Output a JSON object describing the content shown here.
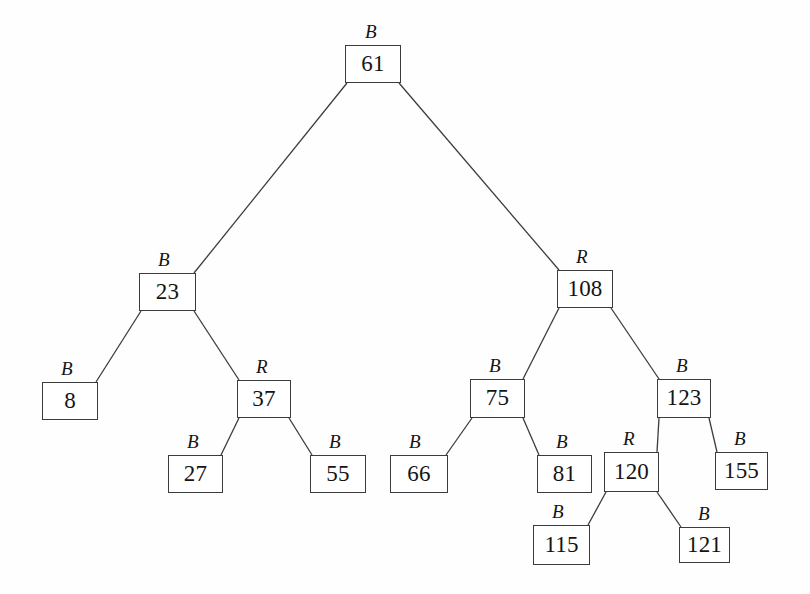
{
  "diagram": {
    "type": "binary-search-tree",
    "background_color": "#fefefe",
    "line_color": "#3c3c3c",
    "text_color": "#141414",
    "color_legend": {
      "B": "Black",
      "R": "Red"
    },
    "nodes": [
      {
        "id": "n61",
        "value": "61",
        "color_label": "B",
        "x": 345,
        "y": 45,
        "w": 56,
        "h": 38,
        "label_x": 365,
        "label_y": 22,
        "parent": null,
        "side": "root"
      },
      {
        "id": "n23",
        "value": "23",
        "color_label": "B",
        "x": 139,
        "y": 273,
        "w": 57,
        "h": 38,
        "label_x": 158,
        "label_y": 250,
        "parent": "n61",
        "side": "left"
      },
      {
        "id": "n108",
        "value": "108",
        "color_label": "R",
        "x": 557,
        "y": 270,
        "w": 56,
        "h": 38,
        "label_x": 576,
        "label_y": 247,
        "parent": "n61",
        "side": "right"
      },
      {
        "id": "n8",
        "value": "8",
        "color_label": "B",
        "x": 42,
        "y": 382,
        "w": 56,
        "h": 38,
        "label_x": 61,
        "label_y": 359,
        "parent": "n23",
        "side": "left"
      },
      {
        "id": "n37",
        "value": "37",
        "color_label": "R",
        "x": 237,
        "y": 380,
        "w": 54,
        "h": 38,
        "label_x": 256,
        "label_y": 357,
        "parent": "n23",
        "side": "right"
      },
      {
        "id": "n27",
        "value": "27",
        "color_label": "B",
        "x": 168,
        "y": 455,
        "w": 55,
        "h": 38,
        "label_x": 187,
        "label_y": 432,
        "parent": "n37",
        "side": "left"
      },
      {
        "id": "n55",
        "value": "55",
        "color_label": "B",
        "x": 310,
        "y": 455,
        "w": 56,
        "h": 38,
        "label_x": 329,
        "label_y": 432,
        "parent": "n37",
        "side": "right"
      },
      {
        "id": "n75",
        "value": "75",
        "color_label": "B",
        "x": 470,
        "y": 379,
        "w": 55,
        "h": 39,
        "label_x": 489,
        "label_y": 356,
        "parent": "n108",
        "side": "left"
      },
      {
        "id": "n123",
        "value": "123",
        "color_label": "B",
        "x": 657,
        "y": 379,
        "w": 54,
        "h": 39,
        "label_x": 676,
        "label_y": 356,
        "parent": "n108",
        "side": "right"
      },
      {
        "id": "n66",
        "value": "66",
        "color_label": "B",
        "x": 390,
        "y": 455,
        "w": 58,
        "h": 38,
        "label_x": 409,
        "label_y": 432,
        "parent": "n75",
        "side": "left"
      },
      {
        "id": "n81",
        "value": "81",
        "color_label": "B",
        "x": 537,
        "y": 455,
        "w": 55,
        "h": 38,
        "label_x": 556,
        "label_y": 432,
        "parent": "n75",
        "side": "right"
      },
      {
        "id": "n120",
        "value": "120",
        "color_label": "R",
        "x": 604,
        "y": 452,
        "w": 55,
        "h": 40,
        "label_x": 623,
        "label_y": 429,
        "parent": "n123",
        "side": "left"
      },
      {
        "id": "n155",
        "value": "155",
        "color_label": "B",
        "x": 715,
        "y": 452,
        "w": 53,
        "h": 38,
        "label_x": 734,
        "label_y": 429,
        "parent": "n123",
        "side": "right"
      },
      {
        "id": "n115",
        "value": "115",
        "color_label": "B",
        "x": 533,
        "y": 525,
        "w": 57,
        "h": 40,
        "label_x": 552,
        "label_y": 502,
        "parent": "n120",
        "side": "left"
      },
      {
        "id": "n121",
        "value": "121",
        "color_label": "B",
        "x": 679,
        "y": 527,
        "w": 51,
        "h": 36,
        "label_x": 698,
        "label_y": 504,
        "parent": "n120",
        "side": "right"
      }
    ],
    "edges": [
      {
        "from": "n61",
        "to": "n23",
        "side": "left"
      },
      {
        "from": "n61",
        "to": "n108",
        "side": "right"
      },
      {
        "from": "n23",
        "to": "n8",
        "side": "left"
      },
      {
        "from": "n23",
        "to": "n37",
        "side": "right"
      },
      {
        "from": "n37",
        "to": "n27",
        "side": "left"
      },
      {
        "from": "n37",
        "to": "n55",
        "side": "right"
      },
      {
        "from": "n108",
        "to": "n75",
        "side": "left"
      },
      {
        "from": "n108",
        "to": "n123",
        "side": "right"
      },
      {
        "from": "n75",
        "to": "n66",
        "side": "left"
      },
      {
        "from": "n75",
        "to": "n81",
        "side": "right"
      },
      {
        "from": "n123",
        "to": "n120",
        "side": "left"
      },
      {
        "from": "n123",
        "to": "n155",
        "side": "right"
      },
      {
        "from": "n120",
        "to": "n115",
        "side": "left"
      },
      {
        "from": "n120",
        "to": "n121",
        "side": "right"
      }
    ]
  }
}
